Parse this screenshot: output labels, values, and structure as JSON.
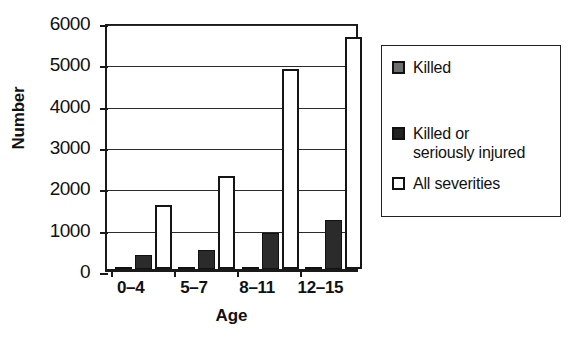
{
  "chart_data": {
    "type": "bar",
    "title": "",
    "xlabel": "Age",
    "ylabel": "Number",
    "categories": [
      "0–4",
      "5–7",
      "8–11",
      "12–15"
    ],
    "series": [
      {
        "name": "Killed",
        "values": [
          10,
          15,
          25,
          55
        ],
        "color": "#5e5e5e"
      },
      {
        "name": "Killed or\nseriously injured",
        "values": [
          350,
          470,
          880,
          1180
        ],
        "color": "#2b2b2b"
      },
      {
        "name": "All severities",
        "values": [
          1550,
          2250,
          4850,
          5620
        ],
        "color": "#ffffff"
      }
    ],
    "ylim": [
      0,
      6000
    ],
    "yticks": [
      0,
      1000,
      2000,
      3000,
      4000,
      5000,
      6000
    ],
    "ytick_labels": [
      "0",
      "1000",
      "2000",
      "3000",
      "4000",
      "5000",
      "6000"
    ],
    "grid": true,
    "grid_axis": "y",
    "legend_position": "right-outside"
  },
  "legend": {
    "entries": [
      {
        "label": "Killed",
        "swatch": "killed"
      },
      {
        "label": "Killed or\nseriously injured",
        "swatch": "ksi"
      },
      {
        "label": "All severities",
        "swatch": "all"
      }
    ]
  },
  "colors": {
    "killed": "#5e5e5e",
    "ksi": "#2b2b2b",
    "all_severities": "#ffffff",
    "axis": "#1a1a1a",
    "grid": "#2b2b2b",
    "background": "#ffffff"
  }
}
